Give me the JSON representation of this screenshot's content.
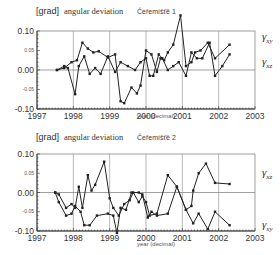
{
  "chart_data": [
    {
      "type": "line",
      "title_unit": "[grad]",
      "title": "angular deviation",
      "station": "Čeřemíšťě 1",
      "xlabel": "year (decimal)",
      "ylabel": "[grad]",
      "xlim": [
        1997,
        2003
      ],
      "ylim": [
        -0.1,
        0.1
      ],
      "xticks": [
        "1997",
        "1998",
        "1999",
        "2000",
        "2001",
        "2002",
        "2003"
      ],
      "yticks": [
        "0.10",
        "0.05",
        "0.00",
        "-0.05",
        "-0.10"
      ],
      "grid": true,
      "series": [
        {
          "name": "γxy",
          "label_main": "γ",
          "label_sub": "xy",
          "points": [
            [
              1997.55,
              0.0
            ],
            [
              1997.75,
              0.005
            ],
            [
              1997.95,
              0.02
            ],
            [
              1998.1,
              0.025
            ],
            [
              1998.25,
              0.07
            ],
            [
              1998.4,
              0.055
            ],
            [
              1998.55,
              0.045
            ],
            [
              1998.7,
              0.048
            ],
            [
              1998.95,
              0.032
            ],
            [
              1999.15,
              0.04
            ],
            [
              1999.3,
              -0.08
            ],
            [
              1999.4,
              -0.085
            ],
            [
              1999.6,
              -0.045
            ],
            [
              1999.75,
              -0.06
            ],
            [
              1999.85,
              -0.04
            ],
            [
              2000.0,
              0.05
            ],
            [
              2000.15,
              0.04
            ],
            [
              2000.3,
              -0.005
            ],
            [
              2000.4,
              0.03
            ],
            [
              2000.5,
              0.025
            ],
            [
              2000.6,
              0.045
            ],
            [
              2000.75,
              0.065
            ],
            [
              2000.95,
              0.14
            ],
            [
              2001.1,
              0.01
            ],
            [
              2001.25,
              0.02
            ],
            [
              2001.35,
              0.045
            ],
            [
              2001.5,
              0.05
            ],
            [
              2001.7,
              0.07
            ],
            [
              2001.9,
              0.03
            ],
            [
              2002.3,
              0.065
            ]
          ]
        },
        {
          "name": "γxz",
          "label_main": "γ",
          "label_sub": "xz",
          "points": [
            [
              1997.55,
              0.0
            ],
            [
              1997.75,
              0.01
            ],
            [
              1997.85,
              0.005
            ],
            [
              1998.05,
              -0.062
            ],
            [
              1998.15,
              0.01
            ],
            [
              1998.3,
              0.035
            ],
            [
              1998.45,
              -0.01
            ],
            [
              1998.6,
              0.005
            ],
            [
              1998.75,
              -0.01
            ],
            [
              1998.95,
              0.035
            ],
            [
              1999.15,
              -0.005
            ],
            [
              1999.3,
              0.02
            ],
            [
              1999.5,
              0.01
            ],
            [
              1999.7,
              0.0
            ],
            [
              1999.85,
              0.02
            ],
            [
              2000.0,
              0.03
            ],
            [
              2000.1,
              -0.015
            ],
            [
              2000.2,
              -0.015
            ],
            [
              2000.35,
              0.04
            ],
            [
              2000.45,
              0.03
            ],
            [
              2000.6,
              0.0
            ],
            [
              2000.75,
              0.01
            ],
            [
              2000.9,
              0.02
            ],
            [
              2001.1,
              -0.015
            ],
            [
              2001.25,
              0.045
            ],
            [
              2001.4,
              0.03
            ],
            [
              2001.55,
              0.03
            ],
            [
              2001.75,
              0.07
            ],
            [
              2001.9,
              -0.015
            ],
            [
              2002.1,
              0.01
            ],
            [
              2002.3,
              0.04
            ]
          ]
        }
      ]
    },
    {
      "type": "line",
      "title_unit": "[grad]",
      "title": "angular deviation",
      "station": "Čeřemíšťě 2",
      "xlabel": "year (decimal)",
      "ylabel": "[grad]",
      "xlim": [
        1997,
        2003
      ],
      "ylim": [
        -0.1,
        0.1
      ],
      "xticks": [
        "1997",
        "1998",
        "1999",
        "2000",
        "2001",
        "2002",
        "2003"
      ],
      "yticks": [
        "0.10",
        "0.05",
        "0.00",
        "-0.05",
        "-0.10"
      ],
      "grid": true,
      "series": [
        {
          "name": "γxz",
          "label_main": "γ",
          "label_sub": "xz",
          "points": [
            [
              1997.5,
              0.0
            ],
            [
              1997.6,
              -0.005
            ],
            [
              1997.8,
              -0.04
            ],
            [
              1997.95,
              -0.03
            ],
            [
              1998.05,
              -0.04
            ],
            [
              1998.15,
              0.015
            ],
            [
              1998.25,
              -0.04
            ],
            [
              1998.4,
              0.045
            ],
            [
              1998.5,
              0.005
            ],
            [
              1998.6,
              0.02
            ],
            [
              1998.85,
              0.08
            ],
            [
              1999.0,
              -0.015
            ],
            [
              1999.1,
              -0.04
            ],
            [
              1999.25,
              -0.06
            ],
            [
              1999.4,
              -0.03
            ],
            [
              1999.55,
              -0.02
            ],
            [
              1999.65,
              0.0
            ],
            [
              1999.8,
              -0.025
            ],
            [
              1999.9,
              -0.01
            ],
            [
              2000.0,
              -0.025
            ],
            [
              2000.1,
              -0.06
            ],
            [
              2000.3,
              -0.055
            ],
            [
              2000.6,
              0.045
            ],
            [
              2000.85,
              0.015
            ],
            [
              2001.1,
              -0.045
            ],
            [
              2001.25,
              -0.035
            ],
            [
              2001.3,
              0.005
            ],
            [
              2001.45,
              0.05
            ],
            [
              2001.65,
              0.075
            ],
            [
              2001.9,
              0.025
            ],
            [
              2002.3,
              0.022
            ]
          ]
        },
        {
          "name": "γxy",
          "label_main": "γ",
          "label_sub": "xy",
          "points": [
            [
              1997.5,
              0.0
            ],
            [
              1997.6,
              -0.025
            ],
            [
              1997.8,
              -0.06
            ],
            [
              1997.95,
              -0.055
            ],
            [
              1998.05,
              -0.035
            ],
            [
              1998.2,
              -0.05
            ],
            [
              1998.3,
              -0.085
            ],
            [
              1998.45,
              -0.085
            ],
            [
              1998.65,
              -0.06
            ],
            [
              1998.95,
              -0.055
            ],
            [
              1999.1,
              -0.06
            ],
            [
              1999.2,
              -0.105
            ],
            [
              1999.3,
              -0.04
            ],
            [
              1999.45,
              -0.045
            ],
            [
              1999.6,
              0.0
            ],
            [
              1999.8,
              0.0
            ],
            [
              1999.9,
              -0.005
            ],
            [
              2000.05,
              -0.065
            ],
            [
              2000.15,
              -0.05
            ],
            [
              2000.3,
              -0.06
            ],
            [
              2000.6,
              -0.055
            ],
            [
              2000.85,
              0.015
            ],
            [
              2001.1,
              -0.045
            ],
            [
              2001.3,
              -0.08
            ],
            [
              2001.45,
              -0.055
            ],
            [
              2001.7,
              -0.095
            ],
            [
              2001.9,
              -0.05
            ],
            [
              2002.3,
              -0.085
            ]
          ]
        }
      ]
    }
  ]
}
